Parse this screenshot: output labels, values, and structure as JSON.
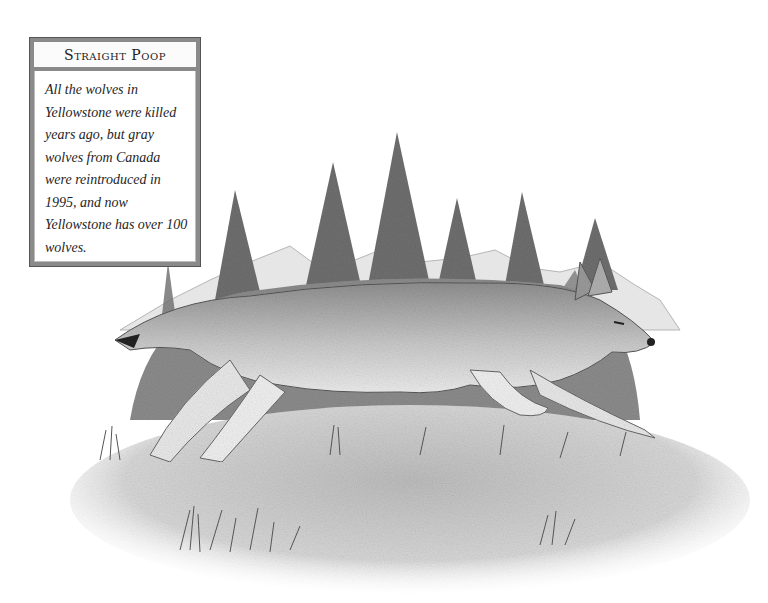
{
  "sidebar": {
    "title": "Straight Poop",
    "body": "All the wolves in Yellowstone were killed years ago, but gray wolves from Canada were reintroduced in 1995, and now Yellowstone has over 100 wolves."
  },
  "illustration": {
    "subject": "gray wolf running",
    "style": "pencil drawing",
    "elements": [
      "pine-trees",
      "mountains",
      "grass",
      "meadow"
    ],
    "colors": {
      "ink": "#444444",
      "shade": "#9a9a9a",
      "paper": "#ffffff"
    }
  }
}
